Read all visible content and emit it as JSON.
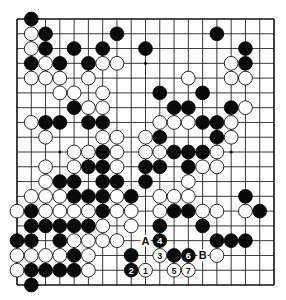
{
  "diagram": {
    "type": "go-board",
    "size": 19,
    "colors": {
      "black": "#0a0a0a",
      "white": "#ffffff",
      "line": "#222222",
      "background": "#ffffff"
    },
    "star_points": [
      [
        3,
        3
      ],
      [
        9,
        3
      ],
      [
        15,
        3
      ],
      [
        3,
        9
      ],
      [
        9,
        9
      ],
      [
        15,
        9
      ],
      [
        3,
        15
      ],
      [
        9,
        15
      ],
      [
        15,
        15
      ]
    ],
    "stones": {
      "black": [
        [
          1,
          0
        ],
        [
          2,
          1
        ],
        [
          7,
          1
        ],
        [
          14,
          1
        ],
        [
          2,
          2
        ],
        [
          4,
          2
        ],
        [
          6,
          2
        ],
        [
          9,
          2
        ],
        [
          16,
          2
        ],
        [
          1,
          3
        ],
        [
          3,
          3
        ],
        [
          5,
          3
        ],
        [
          16,
          3
        ],
        [
          10,
          5
        ],
        [
          13,
          5
        ],
        [
          4,
          6
        ],
        [
          11,
          6
        ],
        [
          12,
          6
        ],
        [
          15,
          6
        ],
        [
          2,
          7
        ],
        [
          3,
          7
        ],
        [
          5,
          7
        ],
        [
          6,
          7
        ],
        [
          13,
          7
        ],
        [
          14,
          7
        ],
        [
          10,
          8
        ],
        [
          14,
          8
        ],
        [
          6,
          9
        ],
        [
          11,
          9
        ],
        [
          12,
          9
        ],
        [
          13,
          9
        ],
        [
          5,
          10
        ],
        [
          6,
          10
        ],
        [
          9,
          10
        ],
        [
          10,
          10
        ],
        [
          12,
          10
        ],
        [
          3,
          11
        ],
        [
          4,
          11
        ],
        [
          6,
          11
        ],
        [
          7,
          11
        ],
        [
          9,
          11
        ],
        [
          4,
          12
        ],
        [
          5,
          12
        ],
        [
          6,
          12
        ],
        [
          8,
          12
        ],
        [
          16,
          12
        ],
        [
          1,
          13
        ],
        [
          6,
          13
        ],
        [
          11,
          13
        ],
        [
          12,
          13
        ],
        [
          17,
          13
        ],
        [
          1,
          14
        ],
        [
          2,
          14
        ],
        [
          3,
          14
        ],
        [
          4,
          14
        ],
        [
          5,
          14
        ],
        [
          10,
          14
        ],
        [
          13,
          14
        ],
        [
          0,
          15
        ],
        [
          1,
          15
        ],
        [
          3,
          15
        ],
        [
          14,
          15
        ],
        [
          15,
          15
        ],
        [
          16,
          15
        ],
        [
          4,
          16
        ],
        [
          8,
          16
        ],
        [
          11,
          16
        ],
        [
          1,
          17
        ],
        [
          2,
          17
        ],
        [
          3,
          17
        ],
        [
          4,
          17
        ],
        [
          1,
          18
        ]
      ],
      "white": [
        [
          1,
          1
        ],
        [
          1,
          2
        ],
        [
          2,
          3
        ],
        [
          6,
          3
        ],
        [
          7,
          3
        ],
        [
          15,
          3
        ],
        [
          1,
          4
        ],
        [
          2,
          4
        ],
        [
          3,
          4
        ],
        [
          5,
          4
        ],
        [
          12,
          4
        ],
        [
          15,
          4
        ],
        [
          16,
          4
        ],
        [
          3,
          5
        ],
        [
          4,
          5
        ],
        [
          6,
          5
        ],
        [
          5,
          6
        ],
        [
          6,
          6
        ],
        [
          16,
          6
        ],
        [
          1,
          7
        ],
        [
          10,
          7
        ],
        [
          11,
          7
        ],
        [
          12,
          7
        ],
        [
          15,
          7
        ],
        [
          2,
          8
        ],
        [
          6,
          8
        ],
        [
          7,
          8
        ],
        [
          9,
          8
        ],
        [
          15,
          8
        ],
        [
          4,
          9
        ],
        [
          5,
          9
        ],
        [
          7,
          9
        ],
        [
          9,
          9
        ],
        [
          10,
          9
        ],
        [
          14,
          9
        ],
        [
          2,
          10
        ],
        [
          4,
          10
        ],
        [
          7,
          10
        ],
        [
          13,
          10
        ],
        [
          14,
          10
        ],
        [
          2,
          11
        ],
        [
          12,
          11
        ],
        [
          1,
          12
        ],
        [
          2,
          12
        ],
        [
          3,
          12
        ],
        [
          7,
          12
        ],
        [
          10,
          12
        ],
        [
          11,
          12
        ],
        [
          12,
          12
        ],
        [
          0,
          13
        ],
        [
          2,
          13
        ],
        [
          3,
          13
        ],
        [
          4,
          13
        ],
        [
          5,
          13
        ],
        [
          7,
          13
        ],
        [
          8,
          13
        ],
        [
          10,
          13
        ],
        [
          13,
          13
        ],
        [
          14,
          13
        ],
        [
          16,
          13
        ],
        [
          6,
          14
        ],
        [
          8,
          14
        ],
        [
          4,
          15
        ],
        [
          5,
          15
        ],
        [
          6,
          15
        ],
        [
          7,
          15
        ],
        [
          0,
          16
        ],
        [
          1,
          16
        ],
        [
          2,
          16
        ],
        [
          3,
          16
        ],
        [
          5,
          16
        ],
        [
          14,
          16
        ],
        [
          0,
          17
        ],
        [
          5,
          17
        ]
      ]
    },
    "numbered_moves": [
      {
        "number": "1",
        "color": "white",
        "col": 9,
        "row": 17
      },
      {
        "number": "2",
        "color": "black",
        "col": 8,
        "row": 17
      },
      {
        "number": "3",
        "color": "white",
        "col": 10,
        "row": 16
      },
      {
        "number": "4",
        "color": "black",
        "col": 10,
        "row": 15
      },
      {
        "number": "5",
        "color": "white",
        "col": 11,
        "row": 17
      },
      {
        "number": "6",
        "color": "black",
        "col": 12,
        "row": 16
      },
      {
        "number": "7",
        "color": "white",
        "col": 12,
        "row": 17
      }
    ],
    "letter_labels": [
      {
        "text": "A",
        "col": 9,
        "row": 15
      },
      {
        "text": "B",
        "col": 13,
        "row": 16
      }
    ]
  }
}
